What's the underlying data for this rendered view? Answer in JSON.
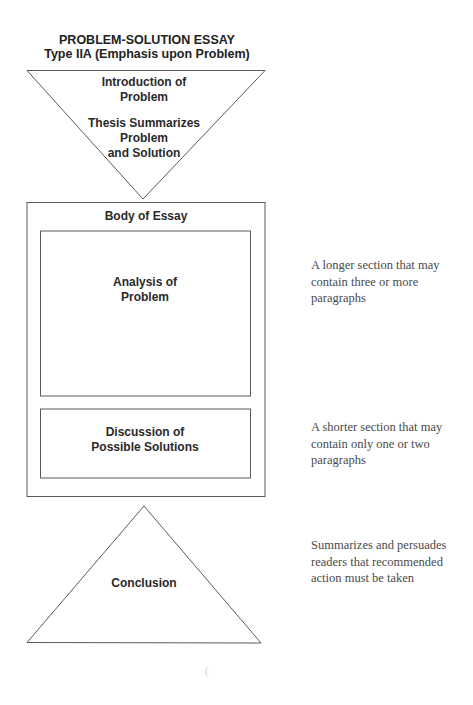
{
  "title": {
    "line1": "PROBLEM-SOLUTION ESSAY",
    "line2": "Type IIA (Emphasis upon Problem)"
  },
  "introduction": {
    "shape": "inverted-triangle",
    "lines": [
      "Introduction of",
      "Problem"
    ],
    "thesis_lines": [
      "Thesis Summarizes",
      "Problem",
      "and Solution"
    ]
  },
  "body": {
    "label": "Body of Essay",
    "sections": [
      {
        "lines": [
          "Analysis of",
          "Problem"
        ],
        "note_lines": [
          "A longer section that may",
          "contain three or more",
          "paragraphs"
        ]
      },
      {
        "lines": [
          "Discussion of",
          "Possible Solutions"
        ],
        "note_lines": [
          "A shorter section that may",
          "contain only one or two",
          "paragraphs"
        ]
      }
    ]
  },
  "conclusion": {
    "shape": "triangle",
    "label": "Conclusion",
    "note_lines": [
      "Summarizes and persuades",
      "readers that recommended",
      "action must be taken"
    ]
  },
  "colors": {
    "stroke": "#5a5a5a",
    "label_text": "#2a2a2a",
    "note_text": "#4a4a4a",
    "background": "#ffffff"
  }
}
